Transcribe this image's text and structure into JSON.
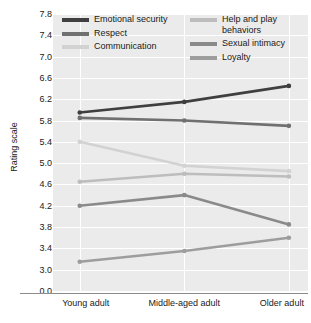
{
  "chart_data": {
    "type": "line",
    "title": "",
    "xlabel": "",
    "ylabel": "Rating scale",
    "categories": [
      "Young adult",
      "Middle-aged adult",
      "Older adult"
    ],
    "ylim": [
      3.0,
      7.8
    ],
    "yticks": [
      "7.8",
      "7.4",
      "7.0",
      "6.6",
      "6.2",
      "5.8",
      "5.4",
      "5.0",
      "4.6",
      "4.2",
      "3.8",
      "3.4",
      "3.0",
      "0.0"
    ],
    "ytick_values": [
      7.8,
      7.4,
      7.0,
      6.6,
      6.2,
      5.8,
      5.4,
      5.0,
      4.6,
      4.2,
      3.8,
      3.4,
      3.0,
      0.0
    ],
    "axis_break": true,
    "grid": true,
    "legend_position": "top-inside",
    "series": [
      {
        "name": "Emotional security",
        "values": [
          5.95,
          6.15,
          6.45
        ],
        "color": "#3f3f3f"
      },
      {
        "name": "Respect",
        "values": [
          5.85,
          5.8,
          5.7
        ],
        "color": "#707070"
      },
      {
        "name": "Communication",
        "values": [
          5.4,
          4.95,
          4.85
        ],
        "color": "#d2d2d2"
      },
      {
        "name": "Help and play\nbehaviors",
        "values": [
          4.65,
          4.8,
          4.75
        ],
        "color": "#bdbdbd"
      },
      {
        "name": "Sexual intimacy",
        "values": [
          4.2,
          4.4,
          3.85
        ],
        "color": "#8a8a8a"
      },
      {
        "name": "Loyalty",
        "values": [
          3.15,
          3.35,
          3.6
        ],
        "color": "#9d9d9d"
      }
    ],
    "legend_left": [
      "Emotional security",
      "Respect",
      "Communication"
    ],
    "legend_right": [
      "Help and play\nbehaviors",
      "Sexual intimacy",
      "Loyalty"
    ]
  },
  "colors": {
    "plot_background": "#ebebeb",
    "gridline": "#ffffff",
    "axis_rule": "#8c8c8c",
    "text": "#1a1a1a"
  }
}
